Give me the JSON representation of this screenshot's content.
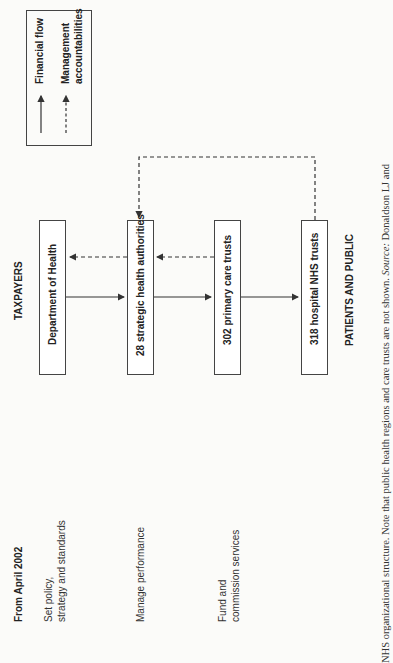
{
  "diagram": {
    "header_left": "From April 2002",
    "top_label": "TAXPAYERS",
    "bottom_label": "PATIENTS AND PUBLIC",
    "roles": [
      {
        "line1": "Set policy,",
        "line2": "strategy and standards"
      },
      {
        "line1": "Manage performance",
        "line2": ""
      },
      {
        "line1": "Fund and",
        "line2": "commission services"
      }
    ],
    "boxes": [
      {
        "label": "Department of Health"
      },
      {
        "label": "28 strategic health authorities"
      },
      {
        "label": "302 primary care trusts"
      },
      {
        "label": "318 hospital NHS trusts"
      }
    ],
    "legend": {
      "financial_flow": "Financial flow",
      "management_line1": "Management",
      "management_line2": "accountabilities"
    }
  },
  "caption": {
    "text": "NHS organizational structure. Note that public health regions and care trusts are not shown.",
    "source_label": "Source:",
    "source_text": "Donaldson LJ and"
  }
}
